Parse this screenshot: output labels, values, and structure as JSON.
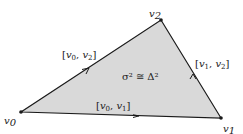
{
  "diagram": {
    "colors": {
      "fill": "#d9d9d9",
      "stroke": "#1a1a1a"
    },
    "vertices": [
      {
        "id": "v0",
        "label": "v",
        "sub": "0",
        "x": 21,
        "y": 112
      },
      {
        "id": "v1",
        "label": "v",
        "sub": "1",
        "x": 221,
        "y": 118
      },
      {
        "id": "v2",
        "label": "v",
        "sub": "2",
        "x": 161,
        "y": 20
      }
    ],
    "edges": [
      {
        "from": "v0",
        "to": "v1",
        "label": "[v0, v1]"
      },
      {
        "from": "v0",
        "to": "v2",
        "label": "[v0, v2]"
      },
      {
        "from": "v1",
        "to": "v2",
        "label": "[v1, v2]"
      }
    ],
    "face_label": "σ² ≅ Δ²"
  }
}
